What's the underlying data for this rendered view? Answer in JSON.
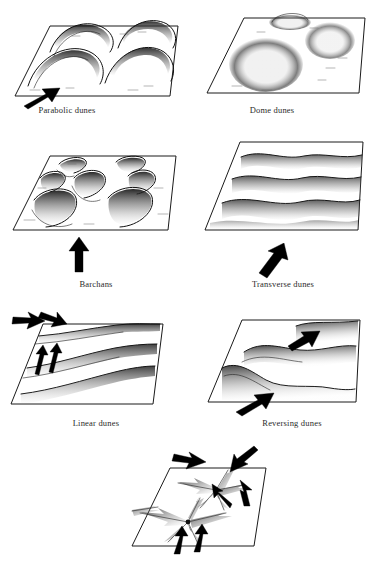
{
  "figure": {
    "background_color": "#ffffff",
    "ink_color": "#1a1a1a",
    "arrow_color": "#000000",
    "stipple_color": "#3a3a3a",
    "panel_count": 7,
    "layout": "3 rows of two panels plus one centered panel at the bottom"
  },
  "panels": [
    {
      "id": "parabolic",
      "label": "Parabolic dunes",
      "row": 1,
      "column": "left",
      "wind_arrows": 1,
      "wind_direction": "lower-left to upper-right",
      "dune_count": 4,
      "dune_shape": "U-shaped / hairpin crescents opening upwind",
      "caption_x": 67,
      "caption_y": 111
    },
    {
      "id": "dome",
      "label": "Dome dunes",
      "row": 1,
      "column": "right",
      "wind_arrows": 0,
      "wind_direction": "none shown",
      "dune_count": 3,
      "dune_shape": "circular stippled mounds without slipfaces",
      "caption_x": 272,
      "caption_y": 111
    },
    {
      "id": "barchans",
      "label": "Barchans",
      "row": 2,
      "column": "left",
      "wind_arrows": 1,
      "wind_direction": "bottom to top",
      "dune_count": 6,
      "dune_shape": "isolated crescents with horns pointing downwind",
      "caption_x": 96,
      "caption_y": 285
    },
    {
      "id": "transverse",
      "label": "Transverse dunes",
      "row": 2,
      "column": "right",
      "wind_arrows": 1,
      "wind_direction": "lower-left to upper-right",
      "dune_count": 4,
      "dune_shape": "long wavy ridges perpendicular to the wind",
      "caption_x": 283,
      "caption_y": 285
    },
    {
      "id": "linear",
      "label": "Linear dunes",
      "row": 3,
      "column": "left",
      "wind_arrows": 4,
      "wind_direction": "two opposing oblique winds",
      "dune_count": 3,
      "dune_shape": "long straight parallel ridges",
      "caption_x": 96,
      "caption_y": 424
    },
    {
      "id": "reversing",
      "label": "Reversing dunes",
      "row": 3,
      "column": "right",
      "wind_arrows": 2,
      "wind_direction": "two opposed winds",
      "dune_count": 3,
      "dune_shape": "asymmetric ridges with reversing crests",
      "caption_x": 291,
      "caption_y": 424
    },
    {
      "id": "star",
      "label": "",
      "row": 4,
      "column": "center",
      "wind_arrows": 6,
      "wind_direction": "multidirectional",
      "dune_count": 2,
      "dune_shape": "radiating arms from a central peak",
      "caption_x": 186,
      "caption_y": 556
    }
  ],
  "captions": {
    "parabolic": "Parabolic dunes",
    "dome": "Dome dunes",
    "barchans": "Barchans",
    "transverse": "Transverse dunes",
    "linear": "Linear dunes",
    "reversing": "Reversing dunes"
  }
}
